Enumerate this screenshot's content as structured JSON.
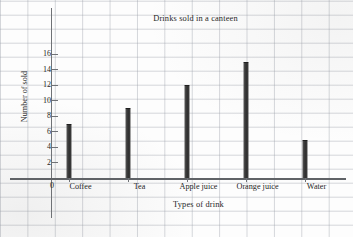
{
  "chart_data": {
    "type": "bar",
    "title": "Drinks sold in a canteen",
    "xlabel": "Types of drink",
    "ylabel": "Number of sold",
    "categories": [
      "Coffee",
      "Tea",
      "Apple juice",
      "Orange juice",
      "Water"
    ],
    "values": [
      7,
      9,
      12,
      15,
      5
    ],
    "ylim": [
      0,
      17
    ],
    "yticks": [
      2,
      4,
      6,
      8,
      10,
      12,
      14,
      16
    ],
    "ytick_labels": [
      "2",
      "4",
      "6",
      "8",
      "10",
      "12",
      "14",
      "16"
    ],
    "origin_label": "0",
    "grid": true,
    "legend": null,
    "bar_color": "#333333",
    "grid_color": "#969ba5",
    "axis_color": "#6f7276",
    "text_color": "#262626",
    "background_color": "#fdfdfd"
  }
}
